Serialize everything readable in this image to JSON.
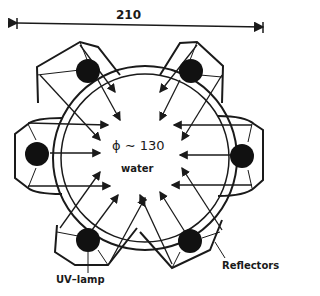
{
  "figure": {
    "dimension_label": "210",
    "diameter_label": "ϕ ∼ 130",
    "center_label": "water",
    "lamp_label": "UV–lamp",
    "reflector_label": "Reflectors"
  },
  "colors": {
    "ink": "#1a1a1a",
    "background": "#ffffff"
  }
}
